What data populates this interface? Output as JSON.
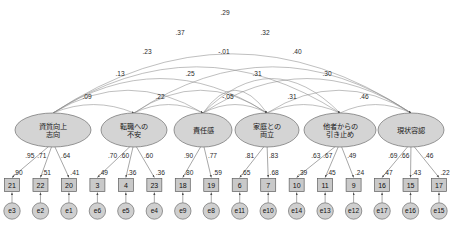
{
  "diagram": {
    "type": "sem-path-diagram",
    "title": "",
    "colors": {
      "latent_fill": "#d4d4d4",
      "observed_fill": "#c9c9c9",
      "error_fill": "#cfcfcf",
      "stroke": "#6e6e6e",
      "arc_stroke": "#8a8a8a",
      "background": "#ffffff"
    }
  },
  "factors": [
    {
      "id": "f1",
      "label_line1": "資質向上",
      "label_line2": "志向",
      "cx": 53,
      "cy": 130,
      "rx": 38,
      "ry": 17
    },
    {
      "id": "f2",
      "label_line1": "転職への",
      "label_line2": "不安",
      "cx": 134,
      "cy": 130,
      "rx": 33,
      "ry": 17
    },
    {
      "id": "f3",
      "label_line1": "責任感",
      "label_line2": "",
      "cx": 203,
      "cy": 130,
      "rx": 29,
      "ry": 17
    },
    {
      "id": "f4",
      "label_line1": "家庭との",
      "label_line2": "両立",
      "cx": 267,
      "cy": 130,
      "rx": 32,
      "ry": 17
    },
    {
      "id": "f5",
      "label_line1": "他者からの",
      "label_line2": "引き止め",
      "cx": 340,
      "cy": 130,
      "rx": 36,
      "ry": 17
    },
    {
      "id": "f6",
      "label_line1": "現状容認",
      "label_line2": "",
      "cx": 411,
      "cy": 130,
      "rx": 33,
      "ry": 17
    }
  ],
  "indicators": [
    {
      "factor": "f1",
      "box": "21",
      "error": "e3",
      "loading": ".95",
      "r2": ".90",
      "bx": 20,
      "by": 185
    },
    {
      "factor": "f1",
      "box": "22",
      "error": "e2",
      "loading": ".71",
      "r2": ".51",
      "bx": 51,
      "by": 185
    },
    {
      "factor": "f1",
      "box": "20",
      "error": "e1",
      "loading": ".64",
      "r2": ".41",
      "bx": 82,
      "by": 185
    },
    {
      "factor": "f2",
      "box": "3",
      "error": "e6",
      "loading": ".70",
      "r2": ".49",
      "bx": 113,
      "by": 185
    },
    {
      "factor": "f2",
      "box": "4",
      "error": "e5",
      "loading": ".60",
      "r2": ".36",
      "bx": 144,
      "by": 185
    },
    {
      "factor": "f2",
      "box": "23",
      "error": "e4",
      "loading": ".60",
      "r2": ".36",
      "bx": 175,
      "by": 185
    },
    {
      "factor": "f3",
      "box": "18",
      "error": "e9",
      "loading": ".90",
      "r2": ".80",
      "bx": 206,
      "by": 185
    },
    {
      "factor": "f3",
      "box": "19",
      "error": "e8",
      "loading": ".77",
      "r2": ".59",
      "bx": 237,
      "by": 185
    },
    {
      "factor": "f4",
      "box": "6",
      "error": "e11",
      "loading": ".81",
      "r2": ".65",
      "bx": 268,
      "by": 185
    },
    {
      "factor": "f4",
      "box": "7",
      "error": "e10",
      "loading": ".83",
      "r2": ".68",
      "bx": 299,
      "by": 185
    },
    {
      "factor": "f5",
      "box": "10",
      "error": "e14",
      "loading": ".63",
      "r2": ".39",
      "bx": 330,
      "by": 185
    },
    {
      "factor": "f5",
      "box": "11",
      "error": "e13",
      "loading": ".67",
      "r2": ".45",
      "bx": 361,
      "by": 185
    },
    {
      "factor": "f5",
      "box": "9",
      "error": "e12",
      "loading": ".49",
      "r2": ".24",
      "bx": 392,
      "by": 185
    },
    {
      "factor": "f6",
      "box": "16",
      "error": "e17",
      "loading": ".69",
      "r2": ".47",
      "bx": 423,
      "by": 185
    },
    {
      "factor": "f6",
      "box": "15",
      "error": "e16",
      "loading": ".66",
      "r2": ".43",
      "bx": 454,
      "by": 185
    },
    {
      "factor": "f6",
      "box": "17",
      "error": "e15",
      "loading": ".46",
      "r2": ".22",
      "bx": 485,
      "by": 185
    }
  ],
  "correlations": [
    {
      "from": "f1",
      "to": "f6",
      "value": ".29",
      "lx": 225,
      "ly": 15,
      "peak": 22
    },
    {
      "from": "f1",
      "to": "f5",
      "value": ".37",
      "lx": 180,
      "ly": 35,
      "peak": 42
    },
    {
      "from": "f2",
      "to": "f6",
      "value": ".32",
      "lx": 265,
      "ly": 35,
      "peak": 42
    },
    {
      "from": "f1",
      "to": "f4",
      "value": ".23",
      "lx": 147,
      "ly": 54,
      "peak": 60
    },
    {
      "from": "f3",
      "to": "f5",
      "value": "-.01",
      "lx": 224,
      "ly": 54,
      "peak": 60
    },
    {
      "from": "f3",
      "to": "f6",
      "value": ".40",
      "lx": 297,
      "ly": 54,
      "peak": 60
    },
    {
      "from": "f1",
      "to": "f3",
      "value": ".13",
      "lx": 120,
      "ly": 76,
      "peak": 78
    },
    {
      "from": "f2",
      "to": "f4",
      "value": ".25",
      "lx": 190,
      "ly": 76,
      "peak": 78
    },
    {
      "from": "f3",
      "to": "f4",
      "value": ".31",
      "lx": 257,
      "ly": 76,
      "peak": 78
    },
    {
      "from": "f4",
      "to": "f6",
      "value": ".30",
      "lx": 327,
      "ly": 76,
      "peak": 78
    },
    {
      "from": "f1",
      "to": "f2",
      "value": ".09",
      "lx": 87,
      "ly": 99,
      "peak": 100
    },
    {
      "from": "f2",
      "to": "f3",
      "value": ".22",
      "lx": 160,
      "ly": 99,
      "peak": 100
    },
    {
      "from": "f3",
      "to": "f4",
      "value": "-.05",
      "lx": 228,
      "ly": 99,
      "peak": 100
    },
    {
      "from": "f4",
      "to": "f5",
      "value": ".31",
      "lx": 292,
      "ly": 99,
      "peak": 100
    },
    {
      "from": "f5",
      "to": "f6",
      "value": ".46",
      "lx": 364,
      "ly": 99,
      "peak": 100
    }
  ]
}
